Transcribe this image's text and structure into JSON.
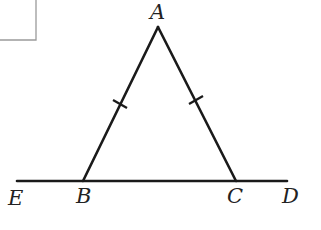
{
  "figure": {
    "type": "isosceles-triangle-with-extended-base",
    "points": {
      "A": "A",
      "B": "B",
      "C": "C",
      "D": "D",
      "E": "E"
    },
    "segments": [
      "AB",
      "AC",
      "ED"
    ],
    "congruence_marks": [
      {
        "segment": "AB",
        "ticks": 1
      },
      {
        "segment": "AC",
        "ticks": 1
      }
    ],
    "line_color": "#1a1a1a",
    "frame_color": "#9a9a9a"
  },
  "labels": {
    "A": "A",
    "B": "B",
    "C": "C",
    "D": "D",
    "E": "E"
  }
}
